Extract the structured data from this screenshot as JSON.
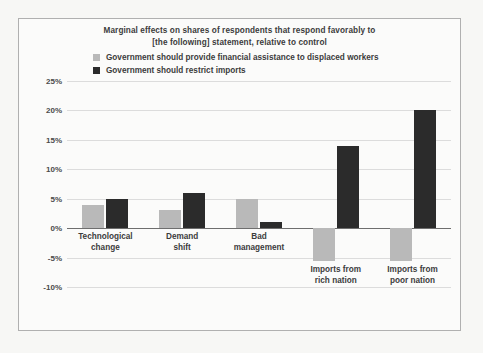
{
  "figure": {
    "title_lines": [
      "Marginal effects on shares of respondents that respond favorably to",
      "[the following] statement, relative to control"
    ],
    "background_color": "#fbfbfa",
    "border_color": "#b0b0b0"
  },
  "legend": {
    "items": [
      {
        "label": "Government should provide financial assistance to displaced workers",
        "color": "#b9b9b9"
      },
      {
        "label": "Government should restrict imports",
        "color": "#2b2b2b"
      }
    ]
  },
  "chart_data": {
    "type": "bar",
    "title": "Marginal effects on shares of respondents that respond favorably to [the following] statement, relative to control",
    "xlabel": "",
    "ylabel": "",
    "ylim": [
      -10,
      25
    ],
    "ytick_labels": [
      "25%",
      "20%",
      "15%",
      "10%",
      "5%",
      "0%",
      "-5%",
      "-10%"
    ],
    "ytick_values": [
      25,
      20,
      15,
      10,
      5,
      0,
      -5,
      -10
    ],
    "grid": true,
    "legend_position": "top",
    "categories": [
      "Technological\nchange",
      "Demand\nshift",
      "Bad\nmanagement",
      "Imports from\nrich nation",
      "Imports from\npoor nation"
    ],
    "series": [
      {
        "name": "Government should provide financial assistance to displaced workers",
        "color": "#b9b9b9",
        "values": [
          4,
          3,
          5,
          -5.5,
          -5.5
        ]
      },
      {
        "name": "Government should restrict imports",
        "color": "#2b2b2b",
        "values": [
          5,
          6,
          1,
          14,
          20
        ]
      }
    ]
  }
}
